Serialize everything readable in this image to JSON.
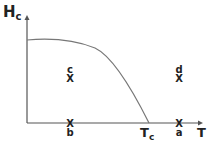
{
  "diagram": {
    "y_axis": {
      "label": "H",
      "subscript": "c"
    },
    "x_axis": {
      "label": "T"
    },
    "critical_temperature": {
      "label": "T",
      "subscript": "c"
    },
    "points": [
      {
        "name": "a",
        "marker": "X"
      },
      {
        "name": "b",
        "marker": "X"
      },
      {
        "name": "c",
        "marker": "X"
      },
      {
        "name": "d",
        "marker": "X"
      }
    ],
    "colors": {
      "axis": "#555555",
      "curve": "#777777",
      "text": "#222222"
    }
  }
}
